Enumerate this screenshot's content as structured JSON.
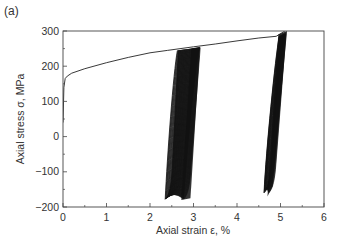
{
  "panel_label": "(a)",
  "chart_data": {
    "type": "line",
    "title": "",
    "xlabel": "Axial strain ε, %",
    "ylabel": "Axial stress σ, MPa",
    "xlim": [
      0,
      6
    ],
    "ylim": [
      -200,
      300
    ],
    "x_ticks": [
      0,
      1,
      2,
      3,
      4,
      5,
      6
    ],
    "y_ticks": [
      -200,
      -100,
      0,
      100,
      200,
      300
    ],
    "grid": false,
    "legend": null,
    "series": [
      {
        "name": "monotonic tension",
        "x": [
          0,
          0.02,
          0.05,
          0.1,
          0.2,
          0.5,
          1.0,
          1.5,
          2.0,
          2.4,
          3.0,
          3.5,
          4.0,
          4.5,
          4.9,
          5.1
        ],
        "y": [
          40,
          140,
          165,
          172,
          180,
          193,
          210,
          225,
          238,
          245,
          255,
          263,
          272,
          280,
          285,
          300
        ]
      },
      {
        "name": "cyclic loops (first unloading at ~2.4%)",
        "x_range": [
          2.3,
          3.15
        ],
        "y_range": [
          -180,
          255
        ],
        "description": "dense bundle of hysteresis loops between ~2.3% and ~3.15% strain, minimum stress ≈ -180 MPa"
      },
      {
        "name": "cyclic loops (second unloading at ~5%)",
        "x_range": [
          4.6,
          5.15
        ],
        "y_range": [
          -165,
          300
        ],
        "description": "dense bundle of hysteresis loops between ~4.6% and ~5.15% strain, minimum stress ≈ -165 MPa"
      }
    ]
  }
}
